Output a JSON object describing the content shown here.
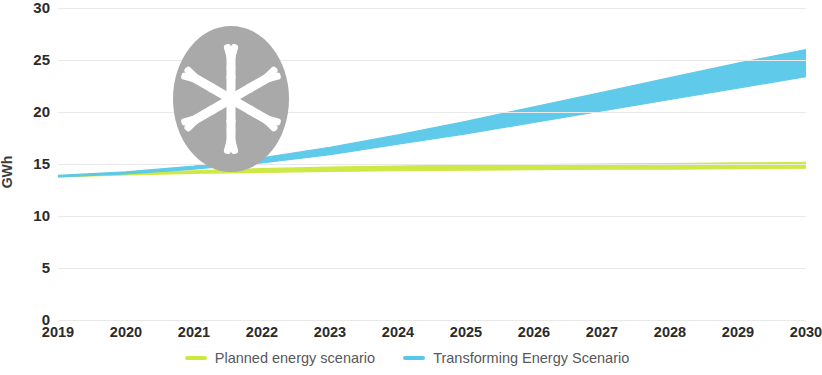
{
  "chart_data": {
    "type": "area",
    "title": "",
    "subtitle": "",
    "xlabel": "",
    "ylabel": "GWh",
    "x": [
      2019,
      2020,
      2021,
      2022,
      2023,
      2024,
      2025,
      2026,
      2027,
      2028,
      2029,
      2030
    ],
    "xtick_labels": [
      "2019",
      "2020",
      "2021",
      "2022",
      "2023",
      "2024",
      "2025",
      "2026",
      "2027",
      "2028",
      "2029",
      "2030"
    ],
    "ytick_labels": [
      "0",
      "5",
      "10",
      "15",
      "20",
      "25",
      "30"
    ],
    "yticks": [
      0,
      5,
      10,
      15,
      20,
      25,
      30
    ],
    "ylim": [
      0,
      30
    ],
    "xlim": [
      2019,
      2030
    ],
    "grid": true,
    "legend_position": "bottom",
    "series": [
      {
        "name": "Planned energy scenario",
        "color": "#cbe83c",
        "band": true,
        "upper": [
          13.85,
          14.15,
          14.35,
          14.55,
          14.7,
          14.8,
          14.9,
          14.95,
          15.0,
          15.05,
          15.1,
          15.15
        ],
        "lower": [
          13.75,
          13.95,
          14.1,
          14.2,
          14.3,
          14.35,
          14.4,
          14.45,
          14.5,
          14.5,
          14.55,
          14.6
        ],
        "values": [
          13.8,
          14.05,
          14.2,
          14.4,
          14.5,
          14.6,
          14.65,
          14.7,
          14.75,
          14.8,
          14.85,
          14.9
        ]
      },
      {
        "name": "Transforming Energy Scenario",
        "color": "#58c8ea",
        "band": true,
        "upper": [
          13.9,
          14.25,
          14.8,
          15.6,
          16.6,
          17.8,
          19.1,
          20.5,
          21.9,
          23.3,
          24.7,
          26.0
        ],
        "lower": [
          13.75,
          14.05,
          14.5,
          15.1,
          15.9,
          16.9,
          17.9,
          19.0,
          20.1,
          21.2,
          22.3,
          23.4
        ],
        "values": [
          13.8,
          14.15,
          14.65,
          15.35,
          16.25,
          17.35,
          18.5,
          19.75,
          21.0,
          22.25,
          23.5,
          24.7
        ]
      }
    ],
    "legend": [
      {
        "label": "Planned energy scenario",
        "color": "#cbe83c"
      },
      {
        "label": "Transforming Energy Scenario",
        "color": "#58c8ea"
      }
    ],
    "annotations": [
      {
        "name": "snowflake-badge",
        "icon": "snowflake-icon",
        "color": "#a8a8a8"
      }
    ]
  }
}
